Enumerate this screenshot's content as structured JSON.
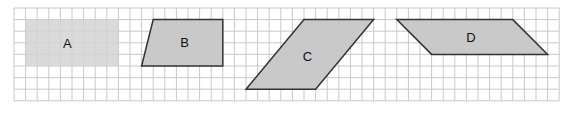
{
  "grid": {
    "origin_x": 14,
    "origin_y": 8,
    "cell": 11.6,
    "cols": 47,
    "rows": 8,
    "line_color": "#c8c8c8"
  },
  "shapes": [
    {
      "label": "A",
      "type": "rectangle",
      "points": [
        [
          1,
          1
        ],
        [
          9,
          1
        ],
        [
          9,
          5
        ],
        [
          1,
          5
        ]
      ],
      "fill": "#d3d3d3",
      "stroke": "none",
      "label_pos": [
        4.6,
        3.1
      ]
    },
    {
      "label": "B",
      "type": "trapezoid",
      "points": [
        [
          12,
          1
        ],
        [
          18,
          1
        ],
        [
          18,
          5
        ],
        [
          11,
          5
        ]
      ],
      "fill": "#c9c9c9",
      "stroke": "#333333",
      "label_pos": [
        14.7,
        3.0
      ]
    },
    {
      "label": "C",
      "type": "parallelogram",
      "points": [
        [
          25,
          1
        ],
        [
          31,
          1
        ],
        [
          26,
          7
        ],
        [
          20,
          7
        ]
      ],
      "fill": "#c9c9c9",
      "stroke": "#333333",
      "label_pos": [
        25.3,
        4.2
      ]
    },
    {
      "label": "D",
      "type": "parallelogram",
      "points": [
        [
          33,
          1
        ],
        [
          43,
          1
        ],
        [
          46,
          4
        ],
        [
          36,
          4
        ]
      ],
      "fill": "#c9c9c9",
      "stroke": "#333333",
      "label_pos": [
        39.4,
        2.6
      ]
    }
  ]
}
